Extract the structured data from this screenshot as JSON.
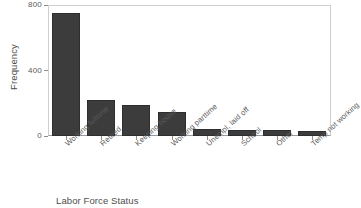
{
  "chart_data": {
    "type": "bar",
    "title": "",
    "xlabel": "Labor Force Status",
    "ylabel": "Frequency",
    "categories": [
      "Working fulltime",
      "Retired",
      "Keeping house",
      "Working parttime",
      "Unempl, laid off",
      "School",
      "Other",
      "Temp not working"
    ],
    "values": [
      751,
      221,
      190,
      147,
      43,
      38,
      35,
      33
    ],
    "ylim": [
      0,
      800
    ],
    "yticks": [
      0,
      400,
      800
    ],
    "ytick_labels": [
      "0",
      "400",
      "800"
    ],
    "grid": false,
    "legend": null,
    "bar_color": "#3c3c3c",
    "axis_color": "#9a9a9a",
    "frame_color": "#cfcfcf",
    "background": "#ffffff"
  }
}
